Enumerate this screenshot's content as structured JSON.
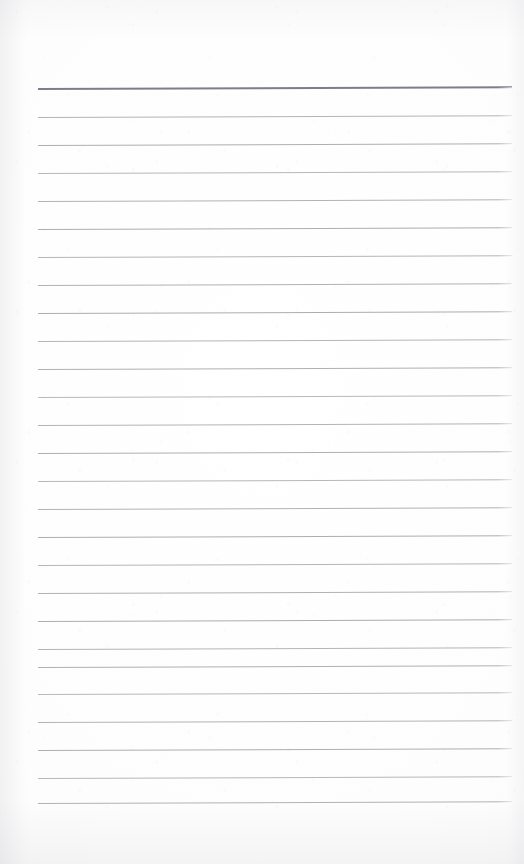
{
  "document": {
    "type": "scanned-lined-paper",
    "title": "Blank ruled notepad page",
    "page_width": 524,
    "page_height": 864,
    "background_color": "#fdfdfd",
    "has_text_content": false,
    "visible_text": ""
  },
  "ruling": {
    "line_color": "#80828a",
    "header_line_color": "#60626c",
    "line_count": 27,
    "header_line_index": 0,
    "first_line_y": 88,
    "line_spacing": 28,
    "left_margin_x": 38,
    "right_margin_x": 512,
    "line_thickness": 1,
    "header_line_thickness": 2,
    "tilt_degrees": -0.22,
    "lines": [
      {
        "index": 0,
        "y": 88,
        "x1": 38,
        "x2": 512,
        "emphasis": "header"
      },
      {
        "index": 1,
        "y": 117,
        "x1": 38,
        "x2": 512,
        "emphasis": "normal"
      },
      {
        "index": 2,
        "y": 145,
        "x1": 38,
        "x2": 512,
        "emphasis": "normal"
      },
      {
        "index": 3,
        "y": 173,
        "x1": 38,
        "x2": 512,
        "emphasis": "normal"
      },
      {
        "index": 4,
        "y": 201,
        "x1": 38,
        "x2": 512,
        "emphasis": "normal"
      },
      {
        "index": 5,
        "y": 229,
        "x1": 38,
        "x2": 512,
        "emphasis": "normal"
      },
      {
        "index": 6,
        "y": 257,
        "x1": 38,
        "x2": 512,
        "emphasis": "normal"
      },
      {
        "index": 7,
        "y": 285,
        "x1": 38,
        "x2": 512,
        "emphasis": "normal"
      },
      {
        "index": 8,
        "y": 313,
        "x1": 38,
        "x2": 512,
        "emphasis": "normal"
      },
      {
        "index": 9,
        "y": 341,
        "x1": 38,
        "x2": 512,
        "emphasis": "normal"
      },
      {
        "index": 10,
        "y": 369,
        "x1": 38,
        "x2": 512,
        "emphasis": "normal"
      },
      {
        "index": 11,
        "y": 397,
        "x1": 38,
        "x2": 512,
        "emphasis": "normal"
      },
      {
        "index": 12,
        "y": 425,
        "x1": 38,
        "x2": 512,
        "emphasis": "normal"
      },
      {
        "index": 13,
        "y": 453,
        "x1": 38,
        "x2": 512,
        "emphasis": "normal"
      },
      {
        "index": 14,
        "y": 481,
        "x1": 38,
        "x2": 512,
        "emphasis": "normal"
      },
      {
        "index": 15,
        "y": 509,
        "x1": 38,
        "x2": 512,
        "emphasis": "normal"
      },
      {
        "index": 16,
        "y": 537,
        "x1": 38,
        "x2": 512,
        "emphasis": "normal"
      },
      {
        "index": 17,
        "y": 565,
        "x1": 38,
        "x2": 512,
        "emphasis": "normal"
      },
      {
        "index": 18,
        "y": 593,
        "x1": 38,
        "x2": 512,
        "emphasis": "normal"
      },
      {
        "index": 19,
        "y": 621,
        "x1": 38,
        "x2": 512,
        "emphasis": "normal"
      },
      {
        "index": 20,
        "y": 649,
        "x1": 38,
        "x2": 512,
        "emphasis": "normal"
      },
      {
        "index": 21,
        "y": 667,
        "x1": 38,
        "x2": 512,
        "emphasis": "normal"
      },
      {
        "index": 22,
        "y": 694,
        "x1": 38,
        "x2": 512,
        "emphasis": "normal"
      },
      {
        "index": 23,
        "y": 722,
        "x1": 38,
        "x2": 512,
        "emphasis": "normal"
      },
      {
        "index": 24,
        "y": 750,
        "x1": 38,
        "x2": 512,
        "emphasis": "normal"
      },
      {
        "index": 25,
        "y": 778,
        "x1": 38,
        "x2": 512,
        "emphasis": "normal"
      },
      {
        "index": 26,
        "y": 803,
        "x1": 38,
        "x2": 512,
        "emphasis": "normal"
      }
    ]
  }
}
